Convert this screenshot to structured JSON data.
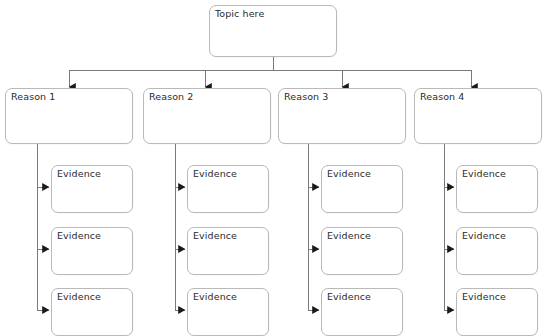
{
  "diagram": {
    "type": "essay-planning-tree",
    "title_text": "Topic here",
    "background_color": "#ffffff",
    "box_border_color": "#b9b9b9",
    "connector_color": "#7a7a7a",
    "text_color": "#2b2b2b",
    "topic": {
      "label": "Topic here",
      "x": 209,
      "y": 5,
      "w": 128,
      "h": 52
    },
    "reasons": [
      {
        "label": "Reason 1",
        "x": 5,
        "y": 88,
        "w": 128,
        "h": 56
      },
      {
        "label": "Reason 2",
        "x": 143,
        "y": 88,
        "w": 128,
        "h": 56
      },
      {
        "label": "Reason 3",
        "x": 278,
        "y": 88,
        "w": 128,
        "h": 56
      },
      {
        "label": "Reason 4",
        "x": 414,
        "y": 88,
        "w": 128,
        "h": 56
      }
    ],
    "evidence_columns": [
      {
        "parent": "Reason 1",
        "stem_x": 37,
        "boxes": [
          {
            "label": "Evidence",
            "x": 51,
            "y": 165,
            "w": 82,
            "h": 48
          },
          {
            "label": "Evidence",
            "x": 51,
            "y": 227,
            "w": 82,
            "h": 48
          },
          {
            "label": "Evidence",
            "x": 51,
            "y": 288,
            "w": 82,
            "h": 48
          }
        ]
      },
      {
        "parent": "Reason 2",
        "stem_x": 175,
        "boxes": [
          {
            "label": "Evidence",
            "x": 187,
            "y": 165,
            "w": 82,
            "h": 48
          },
          {
            "label": "Evidence",
            "x": 187,
            "y": 227,
            "w": 82,
            "h": 48
          },
          {
            "label": "Evidence",
            "x": 187,
            "y": 288,
            "w": 82,
            "h": 48
          }
        ]
      },
      {
        "parent": "Reason 3",
        "stem_x": 308,
        "boxes": [
          {
            "label": "Evidence",
            "x": 321,
            "y": 165,
            "w": 82,
            "h": 48
          },
          {
            "label": "Evidence",
            "x": 321,
            "y": 227,
            "w": 82,
            "h": 48
          },
          {
            "label": "Evidence",
            "x": 321,
            "y": 288,
            "w": 82,
            "h": 48
          }
        ]
      },
      {
        "parent": "Reason 4",
        "stem_x": 444,
        "boxes": [
          {
            "label": "Evidence",
            "x": 456,
            "y": 165,
            "w": 82,
            "h": 48
          },
          {
            "label": "Evidence",
            "x": 456,
            "y": 227,
            "w": 82,
            "h": 48
          },
          {
            "label": "Evidence",
            "x": 456,
            "y": 288,
            "w": 82,
            "h": 48
          }
        ]
      }
    ],
    "bus": {
      "trunk_x": 273,
      "trunk_top": 57,
      "bus_y": 70,
      "bus_left": 69,
      "bus_right": 471,
      "drops": [
        69,
        205,
        342,
        471
      ],
      "drop_bottom": 87
    }
  }
}
